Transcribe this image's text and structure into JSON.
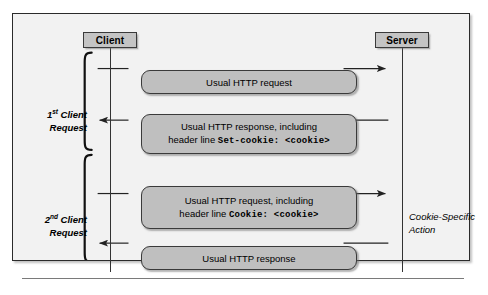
{
  "figure": {
    "type": "sequence-diagram",
    "participants": [
      {
        "id": "client",
        "label": "Client"
      },
      {
        "id": "server",
        "label": "Server"
      }
    ],
    "groups": [
      {
        "id": "first-request",
        "ordinal": "1",
        "ordinal_suffix": "st",
        "label_line1_rest": " Client",
        "label_line2": "Request"
      },
      {
        "id": "second-request",
        "ordinal": "2",
        "ordinal_suffix": "nd",
        "label_line1_rest": " Client",
        "label_line2": "Request"
      }
    ],
    "messages": [
      {
        "id": "msg-1",
        "direction": "client-to-server",
        "line1": "Usual HTTP request",
        "line2_prefix": "",
        "line2_mono": ""
      },
      {
        "id": "msg-2",
        "direction": "server-to-client",
        "line1": "Usual HTTP response, including",
        "line2_prefix": "header line ",
        "line2_mono": "Set-cookie: <cookie>"
      },
      {
        "id": "msg-3",
        "direction": "client-to-server",
        "line1": "Usual HTTP request, including",
        "line2_prefix": "header line ",
        "line2_mono": "Cookie: <cookie>"
      },
      {
        "id": "msg-4",
        "direction": "server-to-client",
        "line1": "Usual HTTP response",
        "line2_prefix": "",
        "line2_mono": ""
      }
    ],
    "annotations": {
      "server_action_line1": "Cookie-Specific",
      "server_action_line2": "Action"
    },
    "colors": {
      "canvas": "#f2f2f2",
      "box_fill": "#bfbfbf",
      "participant_fill": "#c4c4c4",
      "stroke": "#2b2b2b",
      "line": "#333333"
    }
  }
}
